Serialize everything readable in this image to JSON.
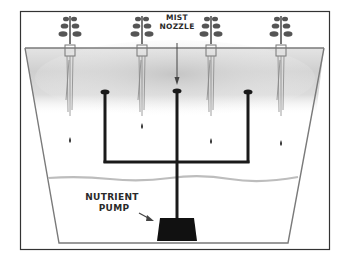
{
  "diagram": {
    "labels": {
      "mist_nozzle_line1": "MIST",
      "mist_nozzle_line2": "NOZZLE",
      "pump_line1": "NUTRIENT",
      "pump_line2": "PUMP"
    },
    "plants": [
      {
        "x": 70,
        "drop_y": 140
      },
      {
        "x": 142,
        "drop_y": 126
      },
      {
        "x": 211,
        "drop_y": 141
      },
      {
        "x": 281,
        "drop_y": 143
      }
    ],
    "nozzles": [
      {
        "x": 105
      },
      {
        "x": 177
      },
      {
        "x": 248
      }
    ],
    "colors": {
      "frame": "#333333",
      "container": "#7a7a7a",
      "pipe": "#1a1a1a",
      "mist": "#c8c8c8",
      "water_line": "#bdbdbd",
      "plant": "#555555"
    }
  }
}
